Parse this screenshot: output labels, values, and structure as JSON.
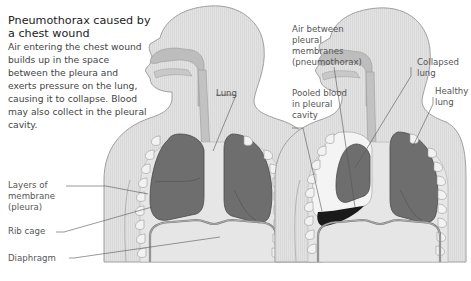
{
  "title": "Pneumothorax caused by a chest wound",
  "description": "Air entering the chest wound builds up in the space between the pleura and exerts pressure on the lung, causing it to collapse. Blood may also collect in the pleural cavity.",
  "colors": {
    "body": "#e3e3e3",
    "outline": "#a8a8a8",
    "airway": "#bdbdbd",
    "lung": "#6e6e6e",
    "blood": "#1a1a1a",
    "rib": "#f2f2f2",
    "text": "#444444"
  },
  "left_figure": {
    "name": "normal chest",
    "labels": {
      "lung": "Lung",
      "pleura": "Layers of membrane (pleura)",
      "pleura_l1": "Layers of",
      "pleura_l2": "membrane",
      "pleura_l3": "(pleura)",
      "rib_cage": "Rib cage",
      "diaphragm": "Diaphragm"
    }
  },
  "right_figure": {
    "name": "pneumothorax chest",
    "labels": {
      "air_l1": "Air between",
      "air_l2": "pleural",
      "air_l3": "membranes",
      "air_l4": "(pneumothorax)",
      "blood_l1": "Pooled blood",
      "blood_l2": "in pleural",
      "blood_l3": "cavity",
      "collapsed_l1": "Collapsed",
      "collapsed_l2": "lung",
      "healthy_l1": "Healthy",
      "healthy_l2": "lung"
    }
  }
}
